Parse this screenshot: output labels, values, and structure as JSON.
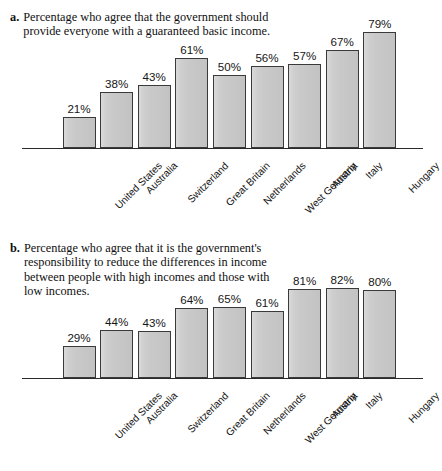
{
  "figure": {
    "panels": [
      {
        "key": "a",
        "marker": "a.",
        "caption": "Percentage who agree that the government should provide everyone with a guaranteed basic income."
      },
      {
        "key": "b",
        "marker": "b.",
        "caption": "Percentage who agree that it is the government's responsibility to reduce the differences in income between people with high incomes and those with low incomes."
      }
    ]
  },
  "chart_data": [
    {
      "type": "bar",
      "title": "Percentage who agree that the government should provide everyone with a guaranteed basic income.",
      "panel_label": "a.",
      "xlabel": "",
      "ylabel": "",
      "ylim": [
        0,
        100
      ],
      "grid": false,
      "legend": "none",
      "value_labels": true,
      "value_suffix": "%",
      "categories": [
        "United States",
        "Australia",
        "Switzerland",
        "Great Britain",
        "Netherlands",
        "West Germany",
        "Austria",
        "Italy",
        "Hungary"
      ],
      "values": [
        21,
        38,
        43,
        61,
        50,
        56,
        57,
        67,
        79
      ],
      "labels": [
        "21%",
        "38%",
        "43%",
        "61%",
        "50%",
        "56%",
        "57%",
        "67%",
        "79%"
      ]
    },
    {
      "type": "bar",
      "title": "Percentage who agree that it is the government's responsibility to reduce the differences in income between people with high incomes and those with low incomes.",
      "panel_label": "b.",
      "xlabel": "",
      "ylabel": "",
      "ylim": [
        0,
        100
      ],
      "grid": false,
      "legend": "none",
      "value_labels": true,
      "value_suffix": "%",
      "categories": [
        "United States",
        "Australia",
        "Switzerland",
        "Great Britain",
        "Netherlands",
        "West Germany",
        "Austria",
        "Italy",
        "Hungary"
      ],
      "values": [
        29,
        44,
        43,
        64,
        65,
        61,
        81,
        82,
        80
      ],
      "labels": [
        "29%",
        "44%",
        "43%",
        "64%",
        "65%",
        "61%",
        "81%",
        "82%",
        "80%"
      ]
    }
  ],
  "style": {
    "bar_fill": "#c9c9c9",
    "bar_stroke": "#3a3a3a",
    "axis_color": "#2a2a2a",
    "text_color": "#111111",
    "background": "#ffffff"
  }
}
